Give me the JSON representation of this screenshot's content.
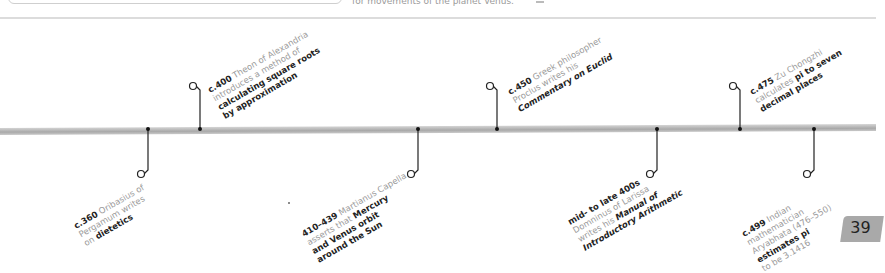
{
  "top_strip": {
    "partial_text": "for movements of the planet Venus."
  },
  "timeline": {
    "events": [
      {
        "date": "c.360",
        "text": "Oribasius of Pergamum writes on ",
        "bold": "dietetics",
        "side": "below",
        "x": 148
      },
      {
        "date": "c.400",
        "text": "Theon of Alexandria introduces a method of ",
        "bold": "calculating square roots by approximation",
        "side": "above",
        "x": 200
      },
      {
        "date": "410–439",
        "text": "Martianus Capella asserts that ",
        "bold": "Mercury and Venus orbit around the Sun",
        "side": "below",
        "x": 418
      },
      {
        "date": "c.450",
        "text": "Greek philosopher Proclus writes his ",
        "bold": "Commentary on Euclid",
        "side": "above",
        "x": 497
      },
      {
        "date": "mid- to late 400s",
        "text": "Domninus of Larissa writes his ",
        "bold": "Manual of Introductory Arithmetic",
        "side": "below",
        "x": 657
      },
      {
        "date": "c.475",
        "text": "Zu Chongzhi calculates ",
        "bold": "pi to seven decimal places",
        "side": "above",
        "x": 740
      },
      {
        "date": "c.499",
        "text": "Indian mathematician Aryabhata (476–550) ",
        "bold": "estimates pi",
        "tail": " to be 3.1416",
        "side": "below",
        "x": 814
      }
    ]
  },
  "page_number": "39"
}
